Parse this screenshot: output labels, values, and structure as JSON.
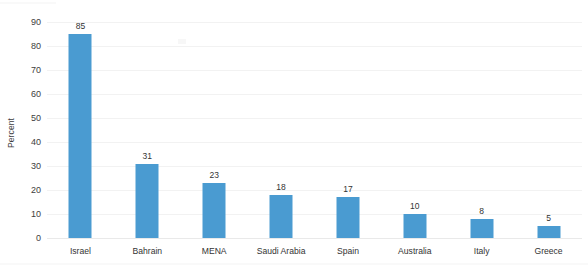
{
  "chart_data": {
    "type": "bar",
    "title": "",
    "xlabel": "",
    "ylabel": "Percent",
    "categories": [
      "Israel",
      "Bahrain",
      "MENA",
      "Saudi Arabia",
      "Spain",
      "Australia",
      "Italy",
      "Greece"
    ],
    "values": [
      85,
      31,
      23,
      18,
      17,
      10,
      8,
      5
    ],
    "value_labels": [
      "85",
      "31",
      "23",
      "18",
      "17",
      "10",
      "8",
      "5"
    ],
    "ylim": [
      0,
      90
    ],
    "ytick_values": [
      0,
      10,
      20,
      30,
      40,
      50,
      60,
      70,
      80,
      90
    ],
    "ytick_labels": [
      "0",
      "10",
      "20",
      "30",
      "40",
      "50",
      "60",
      "70",
      "80",
      "90"
    ],
    "grid": true,
    "grid_axis": "y",
    "legend": false,
    "legend_position": "none",
    "bar_color": "#4a9bd1",
    "background_color": "#ffffff",
    "gridline_color": "#f2f2f2",
    "axis_text_color": "#3d3d3d"
  }
}
